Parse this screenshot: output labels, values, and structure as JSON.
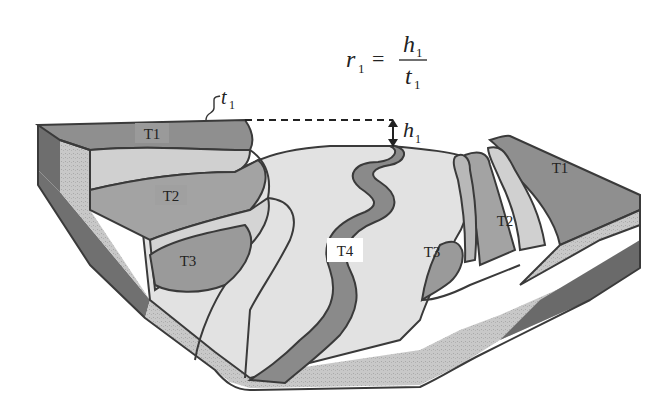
{
  "diagram": {
    "equation": {
      "lhs_var": "r",
      "lhs_sub": "1",
      "equals": "=",
      "num_var": "h",
      "num_sub": "1",
      "den_var": "t",
      "den_sub": "1"
    },
    "annotations": {
      "t_label": "t",
      "t_sub": "1",
      "h_label": "h",
      "h_sub": "1"
    },
    "terraces": [
      {
        "id": "T1-left",
        "label": "T1"
      },
      {
        "id": "T2-left",
        "label": "T2"
      },
      {
        "id": "T3-left",
        "label": "T3"
      },
      {
        "id": "T4",
        "label": "T4"
      },
      {
        "id": "T3-right",
        "label": "T3"
      },
      {
        "id": "T2-right",
        "label": "T2"
      },
      {
        "id": "T1-right",
        "label": "T1"
      }
    ],
    "colors": {
      "t1": "#8f8f8f",
      "t2": "#a6a6a6",
      "t3": "#9c9c9c",
      "floodplain": "#e2e2e2",
      "river": "#8a8a8a",
      "light_band": "#cfcfcf",
      "side_dark": "#6e6e6e",
      "side_speckle": "#c4c4c4",
      "outline": "#3a3a3a"
    }
  }
}
